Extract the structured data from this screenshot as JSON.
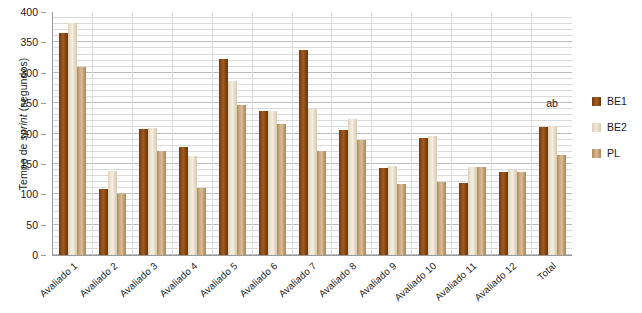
{
  "chart_data": {
    "type": "bar",
    "title": "",
    "xlabel": "",
    "ylabel": "Tempo de sprint (segundos)",
    "ylabel_plain": "Tempo de ",
    "ylabel_italic": "sprint",
    "ylabel_tail": " (segundos)",
    "ylim": [
      0,
      400
    ],
    "ytick_step": 50,
    "minor_gridline_step": 10,
    "grid": true,
    "legend_position": "right",
    "categories": [
      "Avaliado 1",
      "Avaliado 2",
      "Avaliado 3",
      "Avaliado 4",
      "Avaliado 5",
      "Avaliado 6",
      "Avaliado 7",
      "Avaliado 8",
      "Avaliado 9",
      "Avaliado 10",
      "Avaliado 11",
      "Avaliado 12",
      "Total"
    ],
    "ytick_labels": [
      "400",
      "350",
      "300",
      "250",
      "200",
      "150",
      "100",
      "50",
      "0"
    ],
    "ytick_values": [
      400,
      350,
      300,
      250,
      200,
      150,
      100,
      50,
      0
    ],
    "series": [
      {
        "name": "BE1",
        "color": "#8a4a13",
        "values": [
          365,
          108,
          207,
          178,
          323,
          237,
          337,
          205,
          143,
          193,
          118,
          137,
          210
        ]
      },
      {
        "name": "BE2",
        "color": "#ece3d2",
        "values": [
          382,
          138,
          209,
          163,
          287,
          237,
          240,
          224,
          146,
          196,
          145,
          140,
          212
        ]
      },
      {
        "name": "PL",
        "color": "#c9a87c",
        "values": [
          310,
          100,
          172,
          110,
          247,
          215,
          172,
          190,
          117,
          120,
          145,
          136,
          165
        ]
      }
    ],
    "annotations": [
      {
        "text": "ab",
        "category": "Total",
        "value": 240
      }
    ]
  },
  "legend": {
    "items": [
      {
        "label": "BE1",
        "swatch": "be1"
      },
      {
        "label": "BE2",
        "swatch": "be2"
      },
      {
        "label": "PL",
        "swatch": "pl"
      }
    ]
  }
}
